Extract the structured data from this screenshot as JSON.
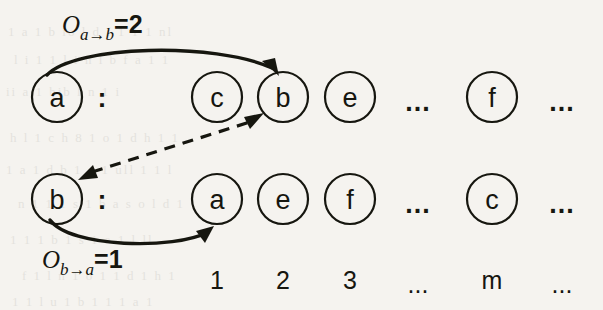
{
  "figure": {
    "background_color": "#f5f3ef",
    "ink_color": "#16160f"
  },
  "rows": [
    {
      "name": "row-a",
      "key": "a",
      "separator": ":",
      "entries": [
        {
          "type": "node",
          "label": "c",
          "cx": 217
        },
        {
          "type": "node",
          "label": "b",
          "cx": 283
        },
        {
          "type": "node",
          "label": "e",
          "cx": 350
        },
        {
          "type": "dots",
          "label": "...",
          "cx": 418
        },
        {
          "type": "node",
          "label": "f",
          "cx": 492
        },
        {
          "type": "dots",
          "label": "...",
          "cx": 562
        }
      ]
    },
    {
      "name": "row-b",
      "key": "b",
      "separator": ":",
      "entries": [
        {
          "type": "node",
          "label": "a",
          "cx": 217
        },
        {
          "type": "node",
          "label": "e",
          "cx": 283
        },
        {
          "type": "node",
          "label": "f",
          "cx": 350
        },
        {
          "type": "dots",
          "label": "...",
          "cx": 418
        },
        {
          "type": "node",
          "label": "c",
          "cx": 492
        },
        {
          "type": "dots",
          "label": "...",
          "cx": 562
        }
      ]
    }
  ],
  "index_row": {
    "name": "position-index-row",
    "cells": [
      {
        "label": "1",
        "cx": 217
      },
      {
        "label": "2",
        "cx": 283
      },
      {
        "label": "3",
        "cx": 350
      },
      {
        "label": "...",
        "cx": 418
      },
      {
        "label": "m",
        "cx": 492
      },
      {
        "label": "...",
        "cx": 562
      }
    ]
  },
  "annotations": {
    "offset_a_to_b": {
      "symbol": "O",
      "subscript": "a→b",
      "equals_value": "=2",
      "full_text": "O(a→b)=2"
    },
    "offset_b_to_a": {
      "symbol": "O",
      "subscript": "b→a",
      "equals_value": "=1",
      "full_text": "O(b→a)=1"
    }
  },
  "edges": [
    {
      "name": "arc-a-to-b",
      "style": "solid",
      "from": "node-a-row-a",
      "to": "node-b-row-a",
      "arrowheads": 1
    },
    {
      "name": "arc-b-to-a",
      "style": "solid",
      "from": "node-b-row-b",
      "to": "node-a-row-b",
      "arrowheads": 1
    },
    {
      "name": "link-b-row-a-to-b-row-b",
      "style": "dashed",
      "from": "node-b-row-a",
      "to": "node-b-row-b",
      "arrowheads": 2
    }
  ],
  "ghost_text": {
    "lines": [
      {
        "t": "1 a 1 b io l d f 1 1 1 nl",
        "x": 8,
        "y": 24
      },
      {
        "t": "l i 1 1 l i n l b f a 1 1",
        "x": 14,
        "y": 52
      },
      {
        "t": "ii a 1 bib l n 1 i",
        "x": 6,
        "y": 84
      },
      {
        "t": "h l 1 c h 8 1 o 1 d h 1 1",
        "x": 10,
        "y": 130
      },
      {
        "t": "1 a 1 d b 1 q 1 ull 1 1 l",
        "x": 6,
        "y": 162
      },
      {
        "t": "n 1 1 1 s 1 b a s o l d 1",
        "x": 18,
        "y": 196
      },
      {
        "t": "1 1 1 b 1 s 1 a 1 l ll",
        "x": 10,
        "y": 232
      },
      {
        "t": "f 1 l n 1 o 1 1 d 1 h 1",
        "x": 22,
        "y": 268
      },
      {
        "t": "1 1 l u 1 b 1 1 1 a 1",
        "x": 12,
        "y": 294
      }
    ]
  }
}
